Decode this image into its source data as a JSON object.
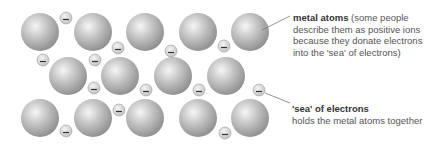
{
  "labels": {
    "metal_atoms": {
      "title": "metal atoms",
      "text": "(some people describe them as positive ions because they donate electrons into the 'sea' of electrons)"
    },
    "sea": {
      "title": "'sea' of electrons",
      "text": "holds the metal atoms together"
    }
  },
  "atoms": [
    {
      "x": 40,
      "y": 32
    },
    {
      "x": 93,
      "y": 32
    },
    {
      "x": 145,
      "y": 32
    },
    {
      "x": 198,
      "y": 32
    },
    {
      "x": 250,
      "y": 32
    },
    {
      "x": 68,
      "y": 76
    },
    {
      "x": 120,
      "y": 76
    },
    {
      "x": 173,
      "y": 76
    },
    {
      "x": 226,
      "y": 76
    },
    {
      "x": 40,
      "y": 118
    },
    {
      "x": 93,
      "y": 118
    },
    {
      "x": 145,
      "y": 118
    },
    {
      "x": 198,
      "y": 118
    },
    {
      "x": 250,
      "y": 118
    }
  ],
  "electrons": [
    {
      "x": 66,
      "y": 18
    },
    {
      "x": 118,
      "y": 48
    },
    {
      "x": 171,
      "y": 51
    },
    {
      "x": 224,
      "y": 46
    },
    {
      "x": 43,
      "y": 60
    },
    {
      "x": 95,
      "y": 60
    },
    {
      "x": 94,
      "y": 88
    },
    {
      "x": 146,
      "y": 90
    },
    {
      "x": 199,
      "y": 90
    },
    {
      "x": 259,
      "y": 90
    },
    {
      "x": 119,
      "y": 110
    },
    {
      "x": 66,
      "y": 131
    },
    {
      "x": 225,
      "y": 133
    }
  ],
  "atom_radius": 19,
  "electron_radius": 6,
  "electron_symbol": "−",
  "colors": {
    "atom_light": "#f4f4f4",
    "atom_mid": "#b4b4b4",
    "atom_dark": "#8a8a8a",
    "leader_line": "#777777"
  }
}
